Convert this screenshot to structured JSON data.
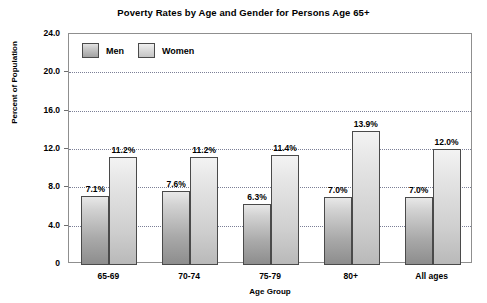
{
  "chart_data": {
    "type": "bar",
    "title": "Poverty Rates by Age and Gender for Persons Age 65+",
    "xlabel": "Age Group",
    "ylabel": "Percent of Population",
    "categories": [
      "65-69",
      "70-74",
      "75-79",
      "80+",
      "All ages"
    ],
    "series": [
      {
        "name": "Men",
        "color": "#a9a9a9",
        "values": [
          7.1,
          7.6,
          6.3,
          7.0,
          7.0
        ],
        "labels": [
          "7.1%",
          "7.6%",
          "6.3%",
          "7.0%",
          "7.0%"
        ]
      },
      {
        "name": "Women",
        "color": "#cfcfcf",
        "values": [
          11.2,
          11.2,
          11.4,
          13.9,
          12.0
        ],
        "labels": [
          "11.2%",
          "11.2%",
          "11.4%",
          "13.9%",
          "12.0%"
        ]
      }
    ],
    "ylim": [
      0,
      24
    ],
    "yticks": [
      0,
      4,
      8,
      12,
      16,
      20,
      24
    ],
    "ytick_labels": [
      "0",
      "4.0",
      "8.0",
      "12.0",
      "16.0",
      "20.0",
      "24.0"
    ],
    "grid": true,
    "grid_axis": "y",
    "legend_position": "top-left-inside"
  },
  "legend": {
    "entries": [
      {
        "label": "Men",
        "swatch": "men-swatch"
      },
      {
        "label": "Women",
        "swatch": "women-swatch"
      }
    ]
  }
}
